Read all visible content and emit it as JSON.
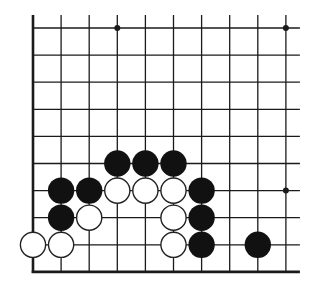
{
  "diagram": {
    "type": "go-board-corner",
    "grid": {
      "columns": 10,
      "rows": 10,
      "origin_x": 33,
      "origin_y": 28,
      "spacing_x": 28.1,
      "spacing_y": 27.1,
      "open_top": true,
      "open_right": true,
      "thick_left_edge": true,
      "thick_bottom_edge": true
    },
    "colors": {
      "line": "#1a1a1a",
      "black_stone": "#111111",
      "white_stone_fill": "#ffffff",
      "white_stone_stroke": "#222222",
      "background": "#ffffff"
    },
    "star_points": [
      {
        "col": 3,
        "row": 0
      },
      {
        "col": 9,
        "row": 0
      },
      {
        "col": 9,
        "row": 6
      }
    ],
    "black_stones": [
      {
        "col": 3,
        "row": 5
      },
      {
        "col": 4,
        "row": 5
      },
      {
        "col": 5,
        "row": 5
      },
      {
        "col": 1,
        "row": 6
      },
      {
        "col": 2,
        "row": 6
      },
      {
        "col": 6,
        "row": 6
      },
      {
        "col": 1,
        "row": 7
      },
      {
        "col": 6,
        "row": 7
      },
      {
        "col": 6,
        "row": 8
      },
      {
        "col": 8,
        "row": 8
      }
    ],
    "white_stones": [
      {
        "col": 3,
        "row": 6
      },
      {
        "col": 4,
        "row": 6
      },
      {
        "col": 5,
        "row": 6
      },
      {
        "col": 2,
        "row": 7
      },
      {
        "col": 5,
        "row": 7
      },
      {
        "col": 0,
        "row": 8
      },
      {
        "col": 1,
        "row": 8
      },
      {
        "col": 5,
        "row": 8
      }
    ]
  }
}
